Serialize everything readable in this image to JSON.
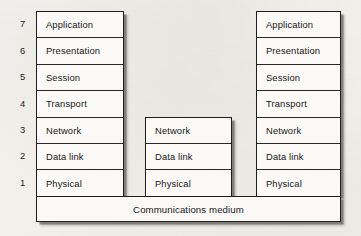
{
  "figure": {
    "background_color": "#f6f4f0",
    "line_color": "#1d1d1d",
    "text_color": "#171717"
  },
  "layer_numbers": [
    "7",
    "6",
    "5",
    "4",
    "3",
    "2",
    "1"
  ],
  "stacks": [
    {
      "name": "left-host-stack",
      "numbered": true,
      "layers": [
        "Application",
        "Presentation",
        "Session",
        "Transport",
        "Network",
        "Data link",
        "Physical"
      ]
    },
    {
      "name": "intermediate-node-stack",
      "numbered": false,
      "layers": [
        "Network",
        "Data link",
        "Physical"
      ]
    },
    {
      "name": "right-host-stack",
      "numbered": false,
      "layers": [
        "Application",
        "Presentation",
        "Session",
        "Transport",
        "Network",
        "Data link",
        "Physical"
      ]
    }
  ],
  "medium": {
    "label": "Communications medium"
  }
}
